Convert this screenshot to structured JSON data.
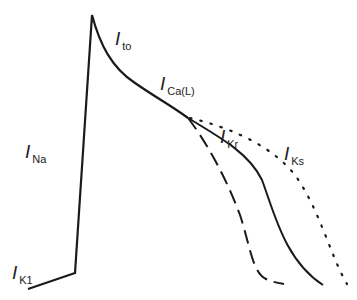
{
  "diagram": {
    "colors": {
      "line": "#1a1a1a",
      "background": "#ffffff"
    },
    "labels": [
      {
        "id": "ina",
        "main": "I",
        "sub": "Na",
        "x": 25,
        "y": 158
      },
      {
        "id": "ito",
        "main": "I",
        "sub": "to",
        "x": 115,
        "y": 45
      },
      {
        "id": "ical",
        "main": "I",
        "sub": "Ca(L)",
        "x": 160,
        "y": 90
      },
      {
        "id": "ikr",
        "main": "I",
        "sub": "Kr",
        "x": 220,
        "y": 143
      },
      {
        "id": "iks",
        "main": "I",
        "sub": "Ks",
        "x": 284,
        "y": 160
      },
      {
        "id": "ik1",
        "main": "I",
        "sub": "K1",
        "x": 12,
        "y": 279
      }
    ],
    "curves": [
      {
        "id": "main-trace",
        "style": "solid"
      },
      {
        "id": "short-repolarization",
        "style": "dashed"
      },
      {
        "id": "normal-repolarization",
        "style": "solid"
      },
      {
        "id": "long-repolarization",
        "style": "dotted"
      }
    ]
  }
}
